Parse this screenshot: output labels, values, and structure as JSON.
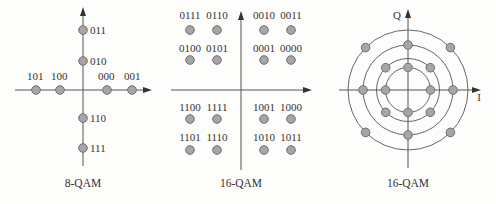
{
  "colors": {
    "background": "#fdfdfc",
    "axis": "#555555",
    "point_fill": "#a6a6a6",
    "point_stroke": "#6e6e6e",
    "text": "#333333"
  },
  "diagrams": [
    {
      "caption": "8-QAM",
      "points": [
        {
          "label": "011"
        },
        {
          "label": "010"
        },
        {
          "label": "101"
        },
        {
          "label": "100"
        },
        {
          "label": "000"
        },
        {
          "label": "001"
        },
        {
          "label": "110"
        },
        {
          "label": "111"
        }
      ]
    },
    {
      "caption": "16-QAM",
      "points": [
        {
          "label": "0111"
        },
        {
          "label": "0110"
        },
        {
          "label": "0010"
        },
        {
          "label": "0011"
        },
        {
          "label": "0100"
        },
        {
          "label": "0101"
        },
        {
          "label": "0001"
        },
        {
          "label": "0000"
        },
        {
          "label": "1100"
        },
        {
          "label": "1111"
        },
        {
          "label": "1001"
        },
        {
          "label": "1000"
        },
        {
          "label": "1101"
        },
        {
          "label": "1110"
        },
        {
          "label": "1010"
        },
        {
          "label": "1011"
        }
      ]
    },
    {
      "caption": "16-QAM",
      "axis_labels": {
        "q": "Q",
        "i": "I"
      },
      "rings": 4,
      "points_count": 16
    }
  ]
}
